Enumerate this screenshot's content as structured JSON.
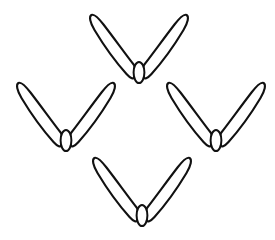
{
  "canvas": {
    "width": 275,
    "height": 240,
    "background_color": "#ffffff",
    "stroke_color": "#111111",
    "fill_color": "#ffffff",
    "stroke_width": 2.1,
    "title": "Four V-shaped blade-pair motifs"
  },
  "figure": {
    "type": "line-art",
    "motif_name": "v-shaped-blade-pair",
    "motif_count": 4,
    "arrangement": "diamond"
  },
  "motifs": [
    {
      "id": "motif-top",
      "position_label": "top",
      "center_x": 139,
      "center_y": 62,
      "bounds": {
        "x": 95,
        "y": 14,
        "width": 88,
        "height": 66
      },
      "rotation": 0,
      "scale": 1.0
    },
    {
      "id": "motif-left",
      "position_label": "left",
      "center_x": 66,
      "center_y": 130,
      "bounds": {
        "x": 18,
        "y": 86,
        "width": 95,
        "height": 62
      },
      "rotation": 0,
      "scale": 1.0
    },
    {
      "id": "motif-right",
      "position_label": "right",
      "center_x": 216,
      "center_y": 130,
      "bounds": {
        "x": 168,
        "y": 86,
        "width": 94,
        "height": 62
      },
      "rotation": 0,
      "scale": 1.0
    },
    {
      "id": "motif-bottom",
      "position_label": "bottom",
      "center_x": 142,
      "center_y": 205,
      "bounds": {
        "x": 95,
        "y": 152,
        "width": 95,
        "height": 73
      },
      "rotation": 0,
      "scale": 1.0
    }
  ],
  "motif_geometry": {
    "left_blade_path": "M -5.0 3.0 C -12.5 -6.5 -24.0 -22.5 -35.5 -37.5 C -40.5 -44.0 -45.0 -48.5 -47.6 -47.0 C -50.2 -45.5 -49.0 -39.5 -44.5 -32.0 C -35.5 -17.0 -21.0 2.5 -12.5 12.0 C -8.5 16.5 -5.2 17.6 -4.0 15.0 C -3.0 12.6 -3.2 7.5 -5.0 3.0 Z",
    "right_blade_path": "M 5.0 3.0 C 12.5 -6.5 24.0 -22.5 35.5 -37.5 C 40.5 -44.0 45.0 -48.5 47.6 -47.0 C 50.2 -45.5 49.0 -39.5 44.5 -32.0 C 35.5 -17.0 21.0 2.5 12.5 12.0 C 8.5 16.5 5.2 17.6 4.0 15.0 C 3.0 12.6 3.2 7.5 5.0 3.0 Z",
    "capsule": {
      "cx": 0,
      "cy": 10.5,
      "rx": 5.4,
      "ry": 10.5
    },
    "blade_count_per_motif": 2,
    "capsule_count_per_motif": 1
  }
}
